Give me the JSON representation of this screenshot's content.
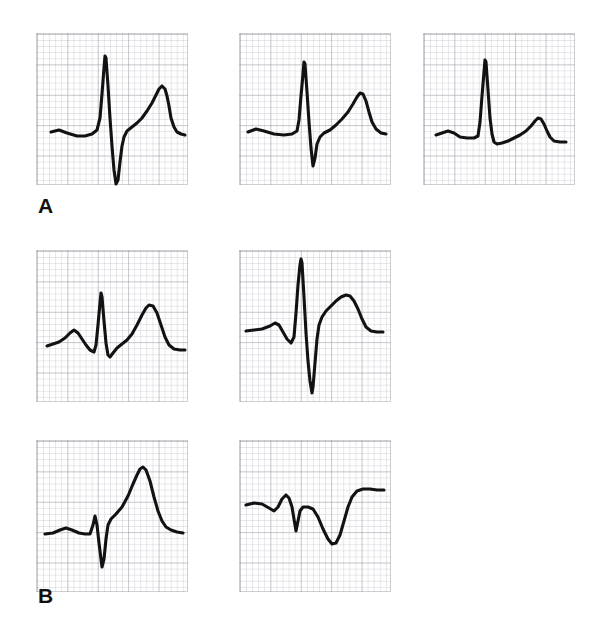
{
  "figure": {
    "background_color": "#ffffff",
    "trace_color": "#121212",
    "grid_color": "#969aa0",
    "panel_size_px": 152,
    "grid_major_px": 30.4,
    "grid_minor_px": 6.08
  },
  "groups": [
    {
      "id": "A",
      "label": "A",
      "label_x": 38,
      "label_y": 195,
      "panel_count": 3
    },
    {
      "id": "B",
      "label": "B",
      "label_x": 38,
      "label_y": 585,
      "panel_count": 4
    }
  ],
  "panels": [
    {
      "id": "a1",
      "group": "A",
      "name": "ecg-panel-a1",
      "x": 36,
      "y": 33,
      "width": 152,
      "height": 152,
      "description": "Tall R wave with deep S wave and elevated ST segment rising into a broad T wave",
      "path": "M 14 98 L 22 96 L 30 99 L 40 102 L 48 102 L 55 100 L 60 96 L 63 84 L 65 60 L 67 34 L 68 22 L 69 24 L 71 52 L 73 84 L 75 112 L 77 136 L 79 150 L 81 146 L 83 128 L 85 112 L 87 103 L 90 97 L 95 93 L 100 89 L 105 84 L 110 77 L 115 69 L 119 61 L 122 55 L 125 52 L 128 55 L 130 62 L 132 72 L 134 84 L 137 93 L 140 98 L 144 100 L 148 101"
    },
    {
      "id": "a2",
      "group": "A",
      "name": "ecg-panel-a2",
      "x": 239,
      "y": 33,
      "width": 152,
      "height": 152,
      "description": "Tall R wave with deep S wave, slightly rounded T wave following a gradual ST rise",
      "path": "M 8 98 L 16 95 L 24 97 L 34 100 L 44 101 L 52 100 L 57 97 L 59 86 L 61 62 L 63 40 L 64 28 L 65 30 L 67 58 L 69 88 L 71 114 L 73 132 L 75 124 L 77 110 L 80 103 L 84 99 L 90 96 L 96 91 L 102 85 L 108 78 L 113 70 L 117 63 L 120 59 L 123 60 L 126 67 L 129 78 L 132 88 L 136 95 L 141 99 L 146 100"
    },
    {
      "id": "a3",
      "group": "A",
      "name": "ecg-panel-a3",
      "x": 423,
      "y": 33,
      "width": 152,
      "height": 152,
      "description": "Tall narrow R wave on a flat baseline with small negative deflection and a low rounded T wave",
      "path": "M 12 101 L 18 99 L 24 97 L 30 99 L 36 103 L 43 104 L 50 104 L 54 102 L 56 88 L 58 62 L 60 38 L 61 26 L 62 28 L 64 56 L 66 84 L 68 100 L 70 108 L 73 110 L 78 109 L 84 107 L 90 104 L 96 101 L 102 97 L 107 92 L 111 87 L 114 84 L 117 85 L 120 90 L 123 97 L 126 103 L 130 107 L 136 108 L 142 108"
    },
    {
      "id": "b1",
      "group": "B",
      "name": "ecg-panel-b1",
      "x": 36,
      "y": 250,
      "width": 152,
      "height": 152,
      "description": "Distinct P wave, narrow QRS with small S, and a prominent broad T wave of similar amplitude",
      "path": "M 10 95 L 16 93 L 22 91 L 28 87 L 33 82 L 37 79 L 41 82 L 45 88 L 49 94 L 53 99 L 57 101 L 59 94 L 61 74 L 63 52 L 64 42 L 65 46 L 67 70 L 69 92 L 71 104 L 73 106 L 76 102 L 80 97 L 85 93 L 90 89 L 95 83 L 100 74 L 105 64 L 109 57 L 112 54 L 116 55 L 120 62 L 124 74 L 128 86 L 132 94 L 137 98 L 143 99 L 148 99"
    },
    {
      "id": "b2",
      "group": "B",
      "name": "ecg-panel-b2",
      "x": 239,
      "y": 250,
      "width": 152,
      "height": 152,
      "description": "Very tall R wave with a deep S wave extending below baseline, followed by an asymmetric T wave",
      "path": "M 6 80 L 14 79 L 22 78 L 30 75 L 35 72 L 39 74 L 43 81 L 47 88 L 51 92 L 54 86 L 56 62 L 58 34 L 60 14 L 61 8 L 62 12 L 64 46 L 66 82 L 68 110 L 70 130 L 72 142 L 73 136 L 75 112 L 77 88 L 79 74 L 82 66 L 86 60 L 91 55 L 96 50 L 101 46 L 106 44 L 110 45 L 114 50 L 118 58 L 122 68 L 126 76 L 131 80 L 137 81 L 143 81"
    },
    {
      "id": "b3",
      "group": "B",
      "name": "ecg-panel-b3",
      "x": 36,
      "y": 440,
      "width": 152,
      "height": 152,
      "description": "Small r wave, deep narrow S wave, then a very tall peaked T wave with slow descent",
      "path": "M 8 93 L 16 92 L 23 89 L 29 87 L 35 89 L 42 92 L 48 93 L 53 93 L 56 84 L 58 75 L 60 84 L 62 102 L 64 118 L 65 126 L 67 118 L 69 98 L 71 84 L 74 78 L 79 73 L 85 66 L 91 55 L 96 43 L 100 34 L 103 28 L 106 26 L 109 29 L 113 40 L 117 56 L 121 70 L 125 80 L 129 86 L 134 89 L 140 91 L 146 92"
    },
    {
      "id": "b4",
      "group": "B",
      "name": "ecg-panel-b4",
      "x": 239,
      "y": 440,
      "width": 152,
      "height": 152,
      "description": "Low amplitude QRS with small r and s waves followed by a deeply inverted symmetric T wave",
      "path": "M 6 64 L 14 62 L 22 63 L 29 67 L 34 70 L 38 66 L 42 58 L 46 54 L 49 57 L 52 66 L 54 78 L 56 90 L 58 80 L 60 70 L 63 66 L 68 66 L 73 68 L 78 76 L 83 88 L 88 98 L 92 103 L 96 102 L 100 94 L 104 80 L 108 66 L 112 56 L 117 50 L 123 48 L 130 48 L 137 49 L 144 49"
    }
  ]
}
